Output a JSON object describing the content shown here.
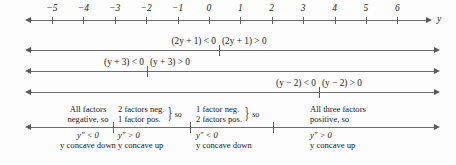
{
  "figure": {
    "axis_variable": "y",
    "colors": {
      "line": "#6e6e6e",
      "text": "#1a1a1a",
      "background": "#fdfdfd"
    }
  },
  "number_line": {
    "tick_labels": [
      "−5",
      "−4",
      "−3",
      "−2",
      "−1",
      "0",
      "1",
      "2",
      "3",
      "4",
      "5",
      "6"
    ],
    "tick_values": [
      -5,
      -4,
      -3,
      -2,
      -1,
      0,
      1,
      2,
      3,
      4,
      5,
      6
    ],
    "axis_label": "y"
  },
  "factor_lines": [
    {
      "id": "factor-2y-plus-1",
      "boundary_value": -0.5,
      "negative_label": "(2y + 1) < 0",
      "positive_label": "(2y + 1) > 0"
    },
    {
      "id": "factor-y-plus-3",
      "boundary_value": -3,
      "negative_label": "(y + 3) < 0",
      "positive_label": "(y + 3) > 0"
    },
    {
      "id": "factor-y-minus-2",
      "boundary_value": 2,
      "negative_label": "(y − 2) < 0",
      "positive_label": "(y − 2) > 0"
    }
  ],
  "summary_line": {
    "boundary_values": [
      -3,
      -0.5,
      2
    ],
    "intervals": [
      {
        "id": "interval-1",
        "above_lines": [
          "All factors",
          "negative, so"
        ],
        "braced": false,
        "brace_suffix": "",
        "below_lines": [
          "y″ < 0",
          "y concave down"
        ]
      },
      {
        "id": "interval-2",
        "above_lines": [
          "2 factors neg.",
          "1 factor pos."
        ],
        "braced": true,
        "brace_suffix": "so",
        "below_lines": [
          "y″ > 0",
          "y concave up"
        ]
      },
      {
        "id": "interval-3",
        "above_lines": [
          "1 factor neg.",
          "2 factors pos."
        ],
        "braced": true,
        "brace_suffix": "so",
        "below_lines": [
          "y″ < 0",
          "y concave down"
        ]
      },
      {
        "id": "interval-4",
        "above_lines": [
          "All three factors",
          "positive, so"
        ],
        "braced": false,
        "brace_suffix": "",
        "below_lines": [
          "y″ > 0",
          "y concave up"
        ]
      }
    ]
  }
}
